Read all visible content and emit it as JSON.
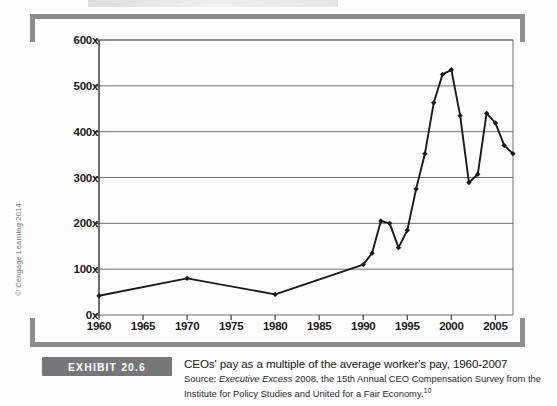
{
  "copyright": "© Cengage Learning 2014",
  "exhibit": {
    "badge_label": "EXHIBIT 20.6",
    "title": "CEOs' pay as a multiple of the average worker's pay, 1960-2007",
    "source_prefix": "Source: ",
    "source_italic": "Executive Excess",
    "source_rest": " 2008, the 15th Annual CEO Compensation Survey from the Institute for Policy Studies and United for a Fair Economy.",
    "source_footnote": "10"
  },
  "colors": {
    "line": "#1b1b1b",
    "grid": "#6f6f72",
    "axis": "#4a4a4c",
    "bracket": "#8d8d8f",
    "badge": "#77777a"
  },
  "chart_data": {
    "type": "line",
    "title": "CEOs' pay as a multiple of the average worker's pay, 1960-2007",
    "xlabel": "",
    "ylabel": "",
    "xlim": [
      1960,
      2007
    ],
    "ylim": [
      0,
      600
    ],
    "grid": true,
    "legend": "none",
    "ytick_labels": [
      "0x",
      "100x",
      "200x",
      "300x",
      "400x",
      "500x",
      "600x"
    ],
    "ytick_values": [
      0,
      100,
      200,
      300,
      400,
      500,
      600
    ],
    "xtick_labels": [
      "1960",
      "1965",
      "1970",
      "1975",
      "1980",
      "1985",
      "1990",
      "1995",
      "2000",
      "2005"
    ],
    "xtick_values": [
      1960,
      1965,
      1970,
      1975,
      1980,
      1985,
      1990,
      1995,
      2000,
      2005
    ],
    "series": [
      {
        "name": "CEO pay multiple",
        "x": [
          1960,
          1970,
          1980,
          1990,
          1991,
          1992,
          1993,
          1994,
          1995,
          1996,
          1997,
          1998,
          1999,
          2000,
          2001,
          2002,
          2003,
          2004,
          2005,
          2006,
          2007
        ],
        "values": [
          42,
          80,
          45,
          110,
          135,
          205,
          200,
          147,
          185,
          275,
          352,
          463,
          525,
          535,
          435,
          289,
          307,
          440,
          419,
          370,
          352
        ]
      }
    ]
  }
}
